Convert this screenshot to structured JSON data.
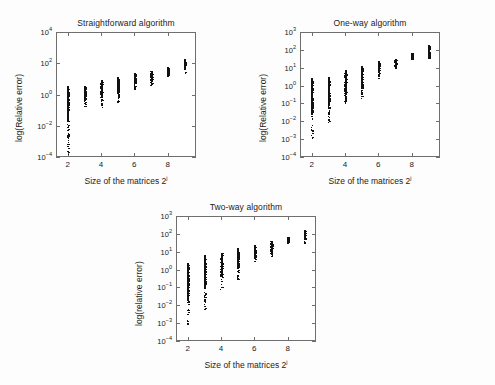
{
  "figure": {
    "background_color": "#fdfdfd",
    "axis_color": "#6f6f6f",
    "marker_color": "#111111",
    "panel_count": 3
  },
  "chart_data": [
    {
      "type": "scatter",
      "title": "Straightforward algorithm",
      "xlabel": "Size of the matrices 2",
      "xlabel_sup": "j",
      "ylabel": "log(Relative error)",
      "xlim": [
        1.3,
        9.7
      ],
      "ylim_log10": [
        -4,
        4
      ],
      "ytick_exponents": [
        -4,
        -2,
        0,
        2,
        4
      ],
      "ytick_labels": [
        "10-4",
        "10-2",
        "100",
        "102",
        "104"
      ],
      "xticks": [
        2,
        4,
        6,
        8
      ],
      "xtick_labels": [
        "2",
        "4",
        "6",
        "8"
      ],
      "grid": false,
      "legend": "none",
      "x": [
        2,
        3,
        4,
        5,
        6,
        7,
        8,
        9
      ],
      "series": [
        {
          "name": "relative error spread",
          "note": "vertical cluster of sample points per matrix size; ranges given as log10 of relative error",
          "columns": [
            {
              "x": 2,
              "log10_min": -3.85,
              "log10_max": 0.55,
              "log10_median": -0.6,
              "n_points": 120
            },
            {
              "x": 3,
              "log10_min": -0.75,
              "log10_max": 0.55,
              "log10_median": -0.05,
              "n_points": 95
            },
            {
              "x": 4,
              "log10_min": -0.85,
              "log10_max": 0.95,
              "log10_median": 0.15,
              "n_points": 95
            },
            {
              "x": 5,
              "log10_min": -0.55,
              "log10_max": 1.1,
              "log10_median": 0.45,
              "n_points": 95
            },
            {
              "x": 6,
              "log10_min": 0.3,
              "log10_max": 1.35,
              "log10_median": 0.9,
              "n_points": 80
            },
            {
              "x": 7,
              "log10_min": 0.6,
              "log10_max": 1.5,
              "log10_median": 1.1,
              "n_points": 80
            },
            {
              "x": 8,
              "log10_min": 1.2,
              "log10_max": 1.75,
              "log10_median": 1.5,
              "n_points": 70
            },
            {
              "x": 9,
              "log10_min": 1.35,
              "log10_max": 2.25,
              "log10_median": 1.85,
              "n_points": 70
            }
          ]
        }
      ]
    },
    {
      "type": "scatter",
      "title": "One-way algorithm",
      "xlabel": "Size of the matrices 2",
      "xlabel_sup": "j",
      "ylabel": "log(Relative error)",
      "xlim": [
        1.3,
        9.7
      ],
      "ylim_log10": [
        -4,
        3
      ],
      "ytick_exponents": [
        -4,
        -3,
        -2,
        -1,
        0,
        1,
        2,
        3
      ],
      "ytick_labels": [
        "10-4",
        "10-3",
        "10-2",
        "10-1",
        "100",
        "101",
        "102",
        "103"
      ],
      "xticks": [
        2,
        4,
        6,
        8
      ],
      "xtick_labels": [
        "2",
        "4",
        "6",
        "8"
      ],
      "grid": false,
      "legend": "none",
      "x": [
        2,
        3,
        4,
        5,
        6,
        7,
        8,
        9
      ],
      "series": [
        {
          "name": "relative error spread",
          "note": "vertical cluster of sample points per matrix size; ranges given as log10 of relative error",
          "columns": [
            {
              "x": 2,
              "log10_min": -2.95,
              "log10_max": 0.45,
              "log10_median": -0.85,
              "n_points": 120
            },
            {
              "x": 3,
              "log10_min": -2.15,
              "log10_max": 0.5,
              "log10_median": -0.45,
              "n_points": 110
            },
            {
              "x": 4,
              "log10_min": -1.0,
              "log10_max": 0.85,
              "log10_median": -0.1,
              "n_points": 100
            },
            {
              "x": 5,
              "log10_min": -0.95,
              "log10_max": 1.1,
              "log10_median": 0.25,
              "n_points": 95
            },
            {
              "x": 6,
              "log10_min": 0.4,
              "log10_max": 1.35,
              "log10_median": 0.95,
              "n_points": 80
            },
            {
              "x": 7,
              "log10_min": 0.95,
              "log10_max": 1.5,
              "log10_median": 1.2,
              "n_points": 75
            },
            {
              "x": 8,
              "log10_min": 1.45,
              "log10_max": 1.85,
              "log10_median": 1.6,
              "n_points": 70
            },
            {
              "x": 9,
              "log10_min": 1.5,
              "log10_max": 2.25,
              "log10_median": 1.8,
              "n_points": 70
            }
          ]
        }
      ]
    },
    {
      "type": "scatter",
      "title": "Two-way algorithm",
      "xlabel": "Size of the matrices 2",
      "xlabel_sup": "j",
      "ylabel": "log(relative error)",
      "xlim": [
        1.3,
        9.7
      ],
      "ylim_log10": [
        -4,
        3
      ],
      "ytick_exponents": [
        -4,
        -3,
        -2,
        -1,
        0,
        1,
        2,
        3
      ],
      "ytick_labels": [
        "10-4",
        "10-3",
        "10-2",
        "10-1",
        "100",
        "101",
        "102",
        "103"
      ],
      "xticks": [
        2,
        4,
        6,
        8
      ],
      "xtick_labels": [
        "2",
        "4",
        "6",
        "8"
      ],
      "grid": false,
      "legend": "none",
      "x": [
        2,
        3,
        4,
        5,
        6,
        7,
        8,
        9
      ],
      "series": [
        {
          "name": "relative error spread",
          "note": "vertical cluster of sample points per matrix size; ranges given as log10 of relative error",
          "columns": [
            {
              "x": 2,
              "log10_min": -3.1,
              "log10_max": 0.35,
              "log10_median": -0.95,
              "n_points": 125
            },
            {
              "x": 3,
              "log10_min": -2.25,
              "log10_max": 0.8,
              "log10_median": -0.4,
              "n_points": 115
            },
            {
              "x": 4,
              "log10_min": -1.1,
              "log10_max": 0.95,
              "log10_median": 0.05,
              "n_points": 100
            },
            {
              "x": 5,
              "log10_min": -0.65,
              "log10_max": 1.2,
              "log10_median": 0.45,
              "n_points": 95
            },
            {
              "x": 6,
              "log10_min": 0.5,
              "log10_max": 1.4,
              "log10_median": 1.0,
              "n_points": 80
            },
            {
              "x": 7,
              "log10_min": 0.75,
              "log10_max": 1.6,
              "log10_median": 1.2,
              "n_points": 78
            },
            {
              "x": 8,
              "log10_min": 1.45,
              "log10_max": 1.85,
              "log10_median": 1.6,
              "n_points": 70
            },
            {
              "x": 9,
              "log10_min": 1.5,
              "log10_max": 2.2,
              "log10_median": 1.85,
              "n_points": 70
            }
          ]
        }
      ]
    }
  ]
}
